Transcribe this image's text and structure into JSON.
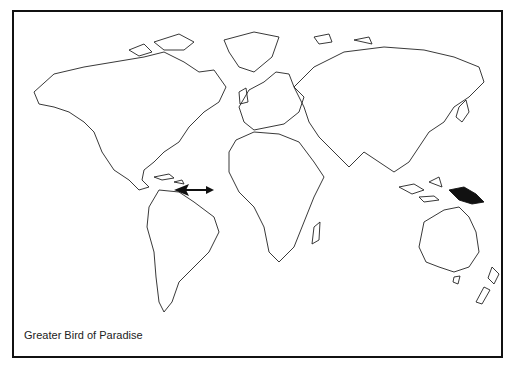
{
  "map": {
    "title": "Greater Bird of Paradise",
    "subject": "world-map",
    "marker": {
      "type": "arrow",
      "pointing_to": "Caribbean / northern South America coast"
    },
    "highlighted_region": "New Guinea",
    "highlight_color": "#111111",
    "border_color": "#111111",
    "background_color": "#ffffff"
  }
}
